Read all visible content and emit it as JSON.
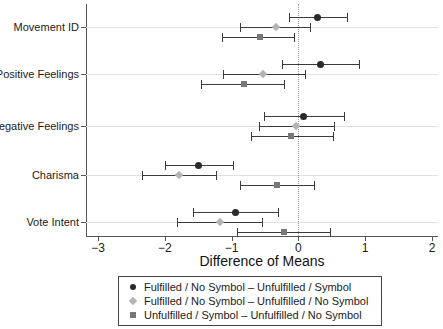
{
  "chart_data": {
    "type": "scatter",
    "title": "",
    "xlabel": "Difference of Means",
    "ylabel": "",
    "xlim": [
      -3,
      2
    ],
    "xticks": [
      -3,
      -2,
      -1,
      0,
      1,
      2
    ],
    "xtick_labels": [
      "−3",
      "−2",
      "−1",
      "0",
      "1",
      "2"
    ],
    "categories": [
      "Movement ID",
      "Positive Feelings",
      "Negative Feelings",
      "Charisma",
      "Vote Intent"
    ],
    "grid": true,
    "reference_line": 0,
    "legend_position": "below",
    "orientation": "horizontal",
    "series": [
      {
        "name": "Fulfilled / No Symbol – Unfulfilled / Symbol",
        "marker": "circle",
        "color": "#2a2a2a",
        "values": [
          0.28,
          0.33,
          0.08,
          -1.49,
          -0.94
        ],
        "ci_low": [
          -0.14,
          -0.25,
          -0.51,
          -1.99,
          -1.58
        ],
        "ci_high": [
          0.73,
          0.9,
          0.68,
          -0.98,
          -0.31
        ]
      },
      {
        "name": "Fulfilled / No Symbol – Unfulfilled / No Symbol",
        "marker": "diamond",
        "color": "#b4b4b4",
        "values": [
          -0.34,
          -0.53,
          -0.03,
          -1.79,
          -1.18
        ],
        "ci_low": [
          -0.87,
          -1.13,
          -0.59,
          -2.34,
          -1.81
        ],
        "ci_high": [
          0.18,
          0.1,
          0.54,
          -1.24,
          -0.54
        ]
      },
      {
        "name": "Unfulfilled / Symbol – Unfulfilled / No Symbol",
        "marker": "square",
        "color": "#787878",
        "values": [
          -0.58,
          -0.82,
          -0.11,
          -0.32,
          -0.22
        ],
        "ci_low": [
          -1.14,
          -1.46,
          -0.71,
          -0.87,
          -0.92
        ],
        "ci_high": [
          -0.06,
          -0.21,
          0.52,
          0.23,
          0.48
        ]
      }
    ]
  },
  "legend": {
    "items": [
      {
        "label": "Fulfilled / No Symbol – Unfulfilled / Symbol",
        "marker": "circle",
        "color": "#2a2a2a"
      },
      {
        "label": "Fulfilled / No Symbol – Unfulfilled / No Symbol",
        "marker": "diamond",
        "color": "#b4b4b4"
      },
      {
        "label": "Unfulfilled / Symbol – Unfulfilled / No Symbol",
        "marker": "square",
        "color": "#787878"
      }
    ]
  }
}
